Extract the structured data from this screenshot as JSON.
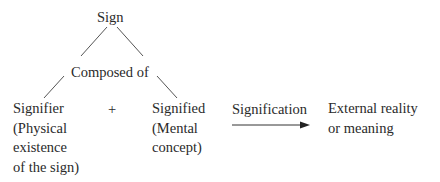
{
  "diagram": {
    "root": "Sign",
    "middle": "Composed of",
    "signifier": {
      "title": "Signifier",
      "lines": [
        "(Physical",
        "existence",
        "of the sign)"
      ]
    },
    "plus": "+",
    "signified": {
      "title": "Signified",
      "lines": [
        "(Mental",
        "concept)"
      ]
    },
    "signification_label": "Signification",
    "external": {
      "lines": [
        "External reality",
        "or meaning"
      ]
    }
  }
}
